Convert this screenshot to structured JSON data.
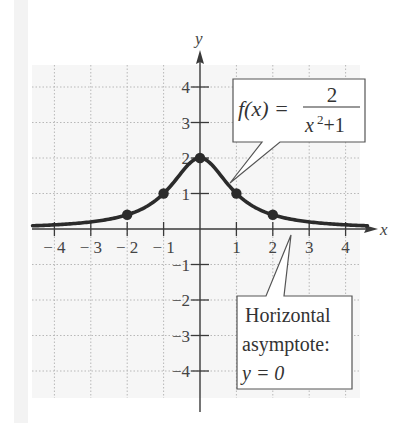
{
  "chart_data": {
    "type": "line",
    "title": "",
    "function_label": {
      "lhs": "f(x) =",
      "numerator": "2",
      "denominator_base": "x",
      "denominator_exp": "2",
      "denominator_rest": "+1"
    },
    "xlabel": "x",
    "ylabel": "y",
    "xlim": [
      -4.5,
      4.5
    ],
    "ylim": [
      -4.5,
      4.5
    ],
    "x_ticks": [
      -4,
      -3,
      -2,
      -1,
      1,
      2,
      3,
      4
    ],
    "x_tick_labels": [
      "− 4",
      "− 3",
      "− 2",
      "− 1",
      "1",
      "2",
      "3",
      "4"
    ],
    "y_ticks": [
      4,
      3,
      2,
      1,
      -1,
      -2,
      -3,
      -4
    ],
    "y_tick_labels": [
      "4",
      "3",
      "2",
      "1",
      "−1",
      "−2",
      "−3",
      "−4"
    ],
    "grid": true,
    "series": [
      {
        "name": "f(x) = 2/(x^2+1)",
        "x": [
          -4.5,
          -4,
          -3,
          -2,
          -1,
          0,
          1,
          2,
          3,
          4,
          4.5
        ],
        "values": [
          0.094,
          0.118,
          0.2,
          0.4,
          1,
          2,
          1,
          0.4,
          0.2,
          0.118,
          0.094
        ]
      }
    ],
    "marked_points": [
      {
        "x": -2,
        "y": 0.4
      },
      {
        "x": -1,
        "y": 1
      },
      {
        "x": 0,
        "y": 2
      },
      {
        "x": 1,
        "y": 1
      },
      {
        "x": 2,
        "y": 0.4
      }
    ],
    "annotations": [
      {
        "id": "function",
        "text": "f(x) = 2/(x²+1)",
        "points_to": {
          "x": 0.85,
          "y": 1.3
        }
      },
      {
        "id": "asymptote",
        "lines": [
          "Horizontal",
          "asymptote:",
          "y = 0"
        ],
        "points_to": {
          "x": 2.5,
          "y": -0.15
        }
      }
    ]
  },
  "annotation_text": {
    "asymptote_line1": "Horizontal",
    "asymptote_line2": "asymptote:",
    "asymptote_line3": "y = 0"
  },
  "colors": {
    "curve": "#2b2b2b",
    "axis": "#3a3a3a",
    "grid": "#b8b8b8",
    "plot_bg": "#f6f6f6",
    "text": "#444444"
  }
}
